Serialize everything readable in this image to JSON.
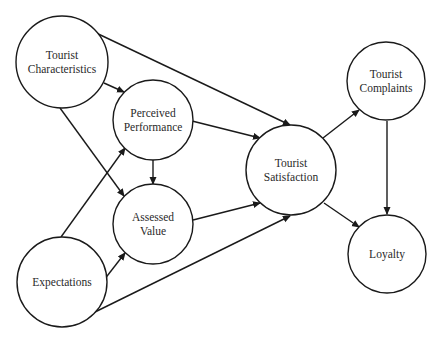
{
  "diagram": {
    "type": "path-model",
    "nodes": [
      {
        "id": "tourist-characteristics",
        "lines": [
          "Tourist",
          "Characteristics"
        ],
        "cx": 62,
        "cy": 62,
        "r": 46
      },
      {
        "id": "perceived-performance",
        "lines": [
          "Perceived",
          "Performance"
        ],
        "cx": 153,
        "cy": 120,
        "r": 40
      },
      {
        "id": "assessed-value",
        "lines": [
          "Assessed",
          "Value"
        ],
        "cx": 153,
        "cy": 224,
        "r": 40
      },
      {
        "id": "expectations",
        "lines": [
          "Expectations"
        ],
        "cx": 62,
        "cy": 282,
        "r": 45
      },
      {
        "id": "tourist-satisfaction",
        "lines": [
          "Tourist",
          "Satisfaction"
        ],
        "cx": 291,
        "cy": 170,
        "r": 45
      },
      {
        "id": "tourist-complaints",
        "lines": [
          "Tourist",
          "Complaints"
        ],
        "cx": 386,
        "cy": 81,
        "r": 39
      },
      {
        "id": "loyalty",
        "lines": [
          "Loyalty"
        ],
        "cx": 387,
        "cy": 254,
        "r": 39
      }
    ],
    "edges": [
      {
        "from": "tourist-characteristics",
        "to": "perceived-performance",
        "x1": 104,
        "y1": 83,
        "x2": 124,
        "y2": 92
      },
      {
        "from": "tourist-characteristics",
        "to": "assessed-value",
        "x1": 60,
        "y1": 108,
        "x2": 124,
        "y2": 196
      },
      {
        "from": "tourist-characteristics",
        "to": "tourist-satisfaction",
        "x1": 92,
        "y1": 31,
        "x2": 290,
        "y2": 125
      },
      {
        "from": "expectations",
        "to": "perceived-performance",
        "x1": 61,
        "y1": 237,
        "x2": 125,
        "y2": 148
      },
      {
        "from": "expectations",
        "to": "assessed-value",
        "x1": 104,
        "y1": 280,
        "x2": 125,
        "y2": 253
      },
      {
        "from": "expectations",
        "to": "tourist-satisfaction",
        "x1": 95,
        "y1": 312,
        "x2": 290,
        "y2": 216
      },
      {
        "from": "perceived-performance",
        "to": "assessed-value",
        "x1": 153,
        "y1": 160,
        "x2": 153,
        "y2": 184
      },
      {
        "from": "perceived-performance",
        "to": "tourist-satisfaction",
        "x1": 192,
        "y1": 121,
        "x2": 260,
        "y2": 138
      },
      {
        "from": "assessed-value",
        "to": "tourist-satisfaction",
        "x1": 193,
        "y1": 220,
        "x2": 260,
        "y2": 203
      },
      {
        "from": "tourist-satisfaction",
        "to": "tourist-complaints",
        "x1": 323,
        "y1": 138,
        "x2": 359,
        "y2": 110
      },
      {
        "from": "tourist-satisfaction",
        "to": "loyalty",
        "x1": 324,
        "y1": 203,
        "x2": 359,
        "y2": 227
      },
      {
        "from": "tourist-complaints",
        "to": "loyalty",
        "x1": 387,
        "y1": 121,
        "x2": 387,
        "y2": 214
      }
    ]
  }
}
